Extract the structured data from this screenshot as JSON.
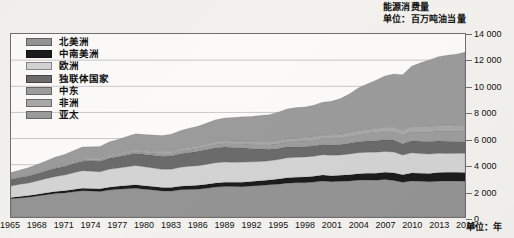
{
  "title": {
    "line1": "能源消费量",
    "line2": "单位：百万吨油当量"
  },
  "axes": {
    "x_unit_label": "单位：年",
    "y_ticks": [
      "0",
      "2 000",
      "4 000",
      "6 000",
      "8 000",
      "10 000",
      "12 000",
      "14 000"
    ],
    "x_ticks": [
      "1965",
      "1968",
      "1971",
      "1974",
      "1977",
      "1980",
      "1983",
      "1986",
      "1989",
      "1992",
      "1995",
      "1998",
      "2001",
      "2004",
      "2007",
      "2010",
      "2013",
      "2016"
    ]
  },
  "legend": {
    "items": [
      {
        "label": "北美洲",
        "color": "#949494"
      },
      {
        "label": "中南美洲",
        "color": "#1c1c1c"
      },
      {
        "label": "欧洲",
        "color": "#d3d3d3"
      },
      {
        "label": "独联体国家",
        "color": "#6b6b6b"
      },
      {
        "label": "中东",
        "color": "#9d9d9d"
      },
      {
        "label": "非洲",
        "color": "#a8a8a8"
      },
      {
        "label": "亚太",
        "color": "#9b9b9b"
      }
    ]
  },
  "chart_data": {
    "type": "area",
    "stacked": true,
    "title": "能源消费量",
    "subtitle": "单位：百万吨油当量",
    "xlabel": "单位：年",
    "ylabel": "百万吨油当量",
    "xlim": [
      1965,
      2016
    ],
    "ylim": [
      0,
      14000
    ],
    "ytick_step": 2000,
    "grid": true,
    "grid_axis": "y",
    "legend_position": "top-left",
    "x": [
      1965,
      1966,
      1967,
      1968,
      1969,
      1970,
      1971,
      1972,
      1973,
      1974,
      1975,
      1976,
      1977,
      1978,
      1979,
      1980,
      1981,
      1982,
      1983,
      1984,
      1985,
      1986,
      1987,
      1988,
      1989,
      1990,
      1991,
      1992,
      1993,
      1994,
      1995,
      1996,
      1997,
      1998,
      1999,
      2000,
      2001,
      2002,
      2003,
      2004,
      2005,
      2006,
      2007,
      2008,
      2009,
      2010,
      2011,
      2012,
      2013,
      2014,
      2015,
      2016
    ],
    "series": [
      {
        "name": "北美洲",
        "color": "#949494",
        "values": [
          1390,
          1460,
          1520,
          1610,
          1710,
          1790,
          1840,
          1930,
          2010,
          1980,
          1950,
          2060,
          2120,
          2170,
          2200,
          2130,
          2070,
          1990,
          1980,
          2080,
          2110,
          2130,
          2200,
          2290,
          2330,
          2330,
          2320,
          2370,
          2410,
          2460,
          2510,
          2590,
          2620,
          2630,
          2680,
          2750,
          2700,
          2730,
          2760,
          2820,
          2840,
          2820,
          2870,
          2800,
          2660,
          2760,
          2730,
          2690,
          2740,
          2760,
          2750,
          2730
        ]
      },
      {
        "name": "中南美洲",
        "color": "#1c1c1c",
        "values": [
          110,
          118,
          126,
          134,
          144,
          154,
          164,
          176,
          190,
          198,
          206,
          220,
          232,
          246,
          258,
          264,
          266,
          266,
          268,
          278,
          284,
          294,
          306,
          316,
          324,
          330,
          340,
          352,
          364,
          378,
          392,
          408,
          426,
          438,
          444,
          458,
          458,
          462,
          472,
          492,
          512,
          532,
          556,
          576,
          576,
          604,
          622,
          640,
          656,
          666,
          668,
          668
        ]
      },
      {
        "name": "欧洲",
        "color": "#d3d3d3",
        "values": [
          880,
          930,
          960,
          1020,
          1090,
          1160,
          1200,
          1270,
          1340,
          1330,
          1300,
          1370,
          1390,
          1430,
          1480,
          1450,
          1410,
          1400,
          1410,
          1440,
          1480,
          1500,
          1530,
          1550,
          1550,
          1530,
          1540,
          1500,
          1480,
          1460,
          1490,
          1530,
          1520,
          1530,
          1530,
          1550,
          1570,
          1560,
          1590,
          1600,
          1600,
          1610,
          1590,
          1590,
          1500,
          1550,
          1500,
          1490,
          1480,
          1440,
          1450,
          1470
        ]
      },
      {
        "name": "独联体国家",
        "color": "#6b6b6b",
        "values": [
          480,
          510,
          540,
          570,
          600,
          630,
          660,
          700,
          730,
          770,
          800,
          840,
          870,
          900,
          930,
          950,
          970,
          990,
          1010,
          1040,
          1070,
          1100,
          1130,
          1150,
          1150,
          1130,
          1100,
          1020,
          950,
          880,
          850,
          840,
          810,
          790,
          780,
          790,
          800,
          800,
          820,
          840,
          860,
          890,
          900,
          920,
          870,
          920,
          940,
          950,
          940,
          930,
          910,
          900
        ]
      },
      {
        "name": "中东",
        "color": "#9d9d9d",
        "values": [
          40,
          45,
          50,
          56,
          62,
          70,
          78,
          86,
          96,
          104,
          114,
          126,
          136,
          148,
          160,
          168,
          176,
          186,
          198,
          212,
          224,
          236,
          250,
          266,
          280,
          294,
          310,
          328,
          344,
          360,
          376,
          394,
          412,
          430,
          444,
          462,
          478,
          496,
          518,
          548,
          578,
          602,
          630,
          656,
          672,
          702,
          722,
          752,
          778,
          798,
          818,
          838
        ]
      },
      {
        "name": "非洲",
        "color": "#a8a8a8",
        "values": [
          48,
          52,
          56,
          60,
          66,
          72,
          78,
          84,
          92,
          96,
          102,
          110,
          116,
          124,
          132,
          140,
          146,
          152,
          158,
          166,
          172,
          178,
          186,
          192,
          198,
          204,
          210,
          216,
          222,
          228,
          236,
          244,
          252,
          258,
          264,
          272,
          280,
          288,
          298,
          312,
          324,
          336,
          350,
          364,
          372,
          388,
          398,
          412,
          424,
          434,
          444,
          454
        ]
      },
      {
        "name": "亚太",
        "color": "#9b9b9b",
        "values": [
          450,
          490,
          530,
          580,
          640,
          710,
          760,
          820,
          900,
          900,
          930,
          1010,
          1070,
          1140,
          1200,
          1210,
          1230,
          1260,
          1310,
          1390,
          1450,
          1510,
          1580,
          1680,
          1740,
          1790,
          1850,
          1910,
          1990,
          2060,
          2160,
          2260,
          2330,
          2340,
          2410,
          2500,
          2570,
          2720,
          2960,
          3250,
          3470,
          3680,
          3900,
          4040,
          4230,
          4600,
          4880,
          5080,
          5250,
          5350,
          5420,
          5540
        ]
      }
    ]
  }
}
